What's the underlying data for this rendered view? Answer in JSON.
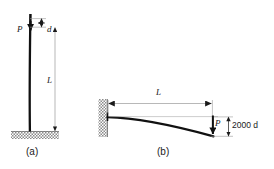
{
  "figure": {
    "panels": [
      {
        "id": "a",
        "caption": "(a)",
        "description": "Vertical column fixed at ground base under axial load P with small lateral deflection d",
        "labels": {
          "load": "P",
          "deflection": "d",
          "length": "L"
        }
      },
      {
        "id": "b",
        "caption": "(b)",
        "description": "Horizontal cantilever beam fixed at wall, loaded by P at free end, deflecting 2000 d",
        "labels": {
          "load": "P",
          "length": "L",
          "deflection": "2000 d"
        }
      }
    ]
  },
  "colors": {
    "ink": "#1a1a1a",
    "member": "#111111",
    "thin_line": "#9a9a9a",
    "hatch": "#8c8c8c",
    "background": "#ffffff"
  }
}
